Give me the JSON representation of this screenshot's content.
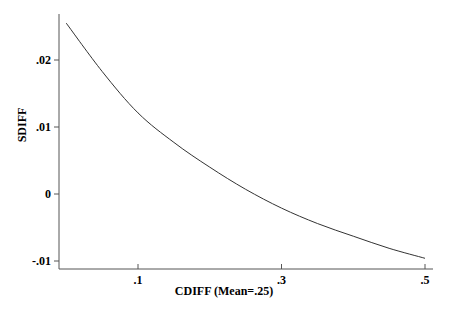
{
  "chart_data": {
    "type": "line",
    "title": "",
    "xlabel": "CDIFF (Mean=.25)",
    "ylabel": "SDIFF",
    "x_ticks": [
      {
        "value": 0.1,
        "label": ".1"
      },
      {
        "value": 0.3,
        "label": ".3"
      },
      {
        "value": 0.5,
        "label": ".5"
      }
    ],
    "y_ticks": [
      {
        "value": 0.02,
        "label": ".02"
      },
      {
        "value": 0.01,
        "label": ".01"
      },
      {
        "value": 0.0,
        "label": "0"
      },
      {
        "value": -0.01,
        "label": "-.01"
      }
    ],
    "xlim": [
      -0.01,
      0.51
    ],
    "ylim": [
      -0.0112,
      0.0275
    ],
    "grid": false,
    "legend": null,
    "series": [
      {
        "name": "SDIFF",
        "color": "#333333",
        "x": [
          0.0,
          0.05,
          0.1,
          0.15,
          0.2,
          0.25,
          0.3,
          0.35,
          0.4,
          0.45,
          0.5
        ],
        "y": [
          0.0255,
          0.0183,
          0.0121,
          0.0077,
          0.004,
          0.0007,
          -0.0021,
          -0.0044,
          -0.0063,
          -0.0081,
          -0.0096
        ]
      }
    ]
  }
}
